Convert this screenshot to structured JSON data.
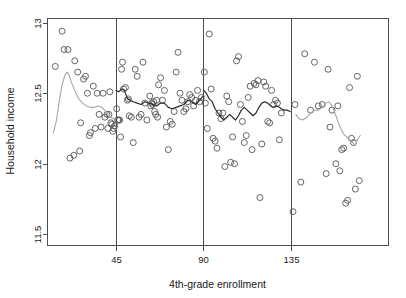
{
  "chart_data": {
    "type": "scatter",
    "title": "",
    "xlabel": "4th-grade enrollment",
    "ylabel": "Household income",
    "xlim": [
      10,
      185
    ],
    "ylim": [
      11.42,
      13.03
    ],
    "grid": false,
    "legend": "none",
    "x_ticks": [
      45,
      90,
      135
    ],
    "x_tick_labels": [
      "45",
      "90",
      "135"
    ],
    "y_ticks": [
      11.5,
      12,
      12.5,
      13
    ],
    "y_tick_labels": [
      "11.5",
      "12",
      "12.5",
      "13"
    ],
    "annotations": [
      "Three vertical reference lines drawn at x = 45, 90 and 135 split the plot into four enrollment bins",
      "A separate smoothed trend line is fitted within each of the four bins",
      "Smoothers for bins 1 and 4 are drawn light gray; smoothers for bins 2 and 3 are drawn black"
    ],
    "marker": {
      "shape": "open-circle",
      "radius_px": 3,
      "fill": "none",
      "stroke": "#555555"
    },
    "vertical_reference_lines": [
      45,
      90,
      135
    ],
    "series": [
      {
        "name": "districts",
        "type": "scatter",
        "points": [
          [
            14.0,
            12.69
          ],
          [
            17.5,
            12.94
          ],
          [
            18.5,
            12.81
          ],
          [
            20.5,
            12.81
          ],
          [
            21.5,
            12.04
          ],
          [
            23.5,
            12.06
          ],
          [
            24.0,
            12.73
          ],
          [
            25.5,
            12.65
          ],
          [
            26.5,
            12.09
          ],
          [
            27.0,
            12.29
          ],
          [
            28.5,
            12.6
          ],
          [
            29.5,
            12.62
          ],
          [
            30.5,
            12.5
          ],
          [
            31.5,
            12.2
          ],
          [
            32.0,
            12.22
          ],
          [
            33.5,
            12.55
          ],
          [
            34.5,
            12.25
          ],
          [
            35.5,
            12.5
          ],
          [
            36.5,
            12.35
          ],
          [
            37.5,
            12.26
          ],
          [
            38.5,
            12.5
          ],
          [
            39.5,
            12.33
          ],
          [
            40.5,
            12.35
          ],
          [
            41.0,
            12.25
          ],
          [
            41.5,
            12.35
          ],
          [
            42.0,
            12.51
          ],
          [
            42.5,
            12.29
          ],
          [
            43.0,
            12.28
          ],
          [
            43.5,
            12.23
          ],
          [
            44.0,
            12.25
          ],
          [
            44.5,
            12.27
          ],
          [
            45.5,
            12.39
          ],
          [
            46.0,
            12.31
          ],
          [
            46.5,
            12.31
          ],
          [
            47.0,
            12.31
          ],
          [
            47.5,
            12.19
          ],
          [
            48.0,
            12.67
          ],
          [
            48.5,
            12.72
          ],
          [
            49.0,
            12.53
          ],
          [
            50.0,
            12.54
          ],
          [
            51.0,
            12.45
          ],
          [
            51.5,
            12.46
          ],
          [
            52.0,
            12.34
          ],
          [
            53.0,
            12.33
          ],
          [
            54.0,
            12.15
          ],
          [
            55.0,
            12.67
          ],
          [
            56.0,
            12.62
          ],
          [
            57.0,
            12.33
          ],
          [
            58.0,
            12.35
          ],
          [
            59.0,
            12.72
          ],
          [
            60.0,
            12.43
          ],
          [
            61.0,
            12.31
          ],
          [
            62.5,
            12.48
          ],
          [
            63.0,
            12.41
          ],
          [
            63.5,
            12.43
          ],
          [
            64.0,
            12.42
          ],
          [
            64.5,
            12.44
          ],
          [
            65.0,
            12.37
          ],
          [
            65.5,
            12.35
          ],
          [
            66.0,
            12.45
          ],
          [
            66.5,
            12.33
          ],
          [
            67.0,
            12.56
          ],
          [
            68.0,
            12.61
          ],
          [
            69.0,
            12.45
          ],
          [
            70.0,
            12.52
          ],
          [
            71.0,
            12.26
          ],
          [
            72.0,
            12.1
          ],
          [
            73.0,
            12.3
          ],
          [
            74.0,
            12.28
          ],
          [
            75.0,
            12.37
          ],
          [
            76.0,
            12.65
          ],
          [
            77.0,
            12.79
          ],
          [
            78.0,
            12.5
          ],
          [
            79.0,
            12.45
          ],
          [
            80.0,
            12.37
          ],
          [
            81.0,
            12.39
          ],
          [
            82.0,
            12.44
          ],
          [
            83.0,
            12.49
          ],
          [
            84.0,
            12.47
          ],
          [
            85.0,
            12.41
          ],
          [
            86.0,
            12.45
          ],
          [
            87.0,
            12.52
          ],
          [
            88.0,
            12.44
          ],
          [
            89.0,
            12.47
          ],
          [
            90.5,
            12.65
          ],
          [
            91.0,
            12.43
          ],
          [
            92.0,
            12.25
          ],
          [
            93.0,
            12.92
          ],
          [
            94.0,
            12.53
          ],
          [
            95.0,
            12.18
          ],
          [
            96.0,
            12.16
          ],
          [
            97.0,
            12.11
          ],
          [
            98.0,
            12.36
          ],
          [
            99.0,
            12.32
          ],
          [
            100.0,
            12.36
          ],
          [
            101.0,
            11.98
          ],
          [
            102.0,
            12.48
          ],
          [
            103.0,
            12.44
          ],
          [
            104.0,
            12.01
          ],
          [
            105.0,
            12.19
          ],
          [
            106.0,
            12.0
          ],
          [
            107.0,
            12.73
          ],
          [
            108.0,
            12.76
          ],
          [
            109.0,
            12.42
          ],
          [
            110.0,
            12.3
          ],
          [
            111.0,
            12.15
          ],
          [
            112.0,
            12.2
          ],
          [
            113.0,
            12.47
          ],
          [
            114.0,
            12.55
          ],
          [
            115.0,
            12.1
          ],
          [
            116.0,
            12.57
          ],
          [
            117.0,
            12.56
          ],
          [
            118.0,
            12.59
          ],
          [
            119.0,
            11.76
          ],
          [
            120.0,
            12.14
          ],
          [
            121.0,
            12.58
          ],
          [
            122.0,
            12.55
          ],
          [
            123.0,
            12.3
          ],
          [
            124.0,
            12.29
          ],
          [
            125.0,
            12.52
          ],
          [
            126.0,
            12.42
          ],
          [
            127.0,
            12.45
          ],
          [
            128.0,
            12.43
          ],
          [
            129.0,
            12.17
          ],
          [
            130.0,
            12.36
          ],
          [
            136.0,
            11.66
          ],
          [
            137.0,
            12.42
          ],
          [
            140.0,
            11.87
          ],
          [
            142.0,
            12.78
          ],
          [
            145.0,
            12.38
          ],
          [
            147.0,
            12.72
          ],
          [
            149.0,
            12.41
          ],
          [
            151.0,
            12.42
          ],
          [
            153.0,
            11.93
          ],
          [
            154.0,
            12.67
          ],
          [
            155.0,
            12.26
          ],
          [
            156.0,
            12.38
          ],
          [
            158.0,
            12.0
          ],
          [
            159.0,
            12.41
          ],
          [
            160.0,
            11.95
          ],
          [
            161.0,
            12.1
          ],
          [
            162.0,
            12.11
          ],
          [
            163.0,
            11.72
          ],
          [
            164.0,
            11.74
          ],
          [
            165.0,
            12.54
          ],
          [
            166.0,
            12.18
          ],
          [
            167.0,
            12.15
          ],
          [
            168.0,
            11.82
          ],
          [
            169.0,
            12.62
          ],
          [
            170.0,
            11.88
          ]
        ]
      },
      {
        "name": "smoother-bin-1",
        "type": "line",
        "color": "#a8a8a8",
        "points": [
          [
            13.0,
            12.22
          ],
          [
            14.5,
            12.3
          ],
          [
            16.0,
            12.44
          ],
          [
            17.5,
            12.56
          ],
          [
            19.0,
            12.63
          ],
          [
            20.0,
            12.65
          ],
          [
            21.0,
            12.63
          ],
          [
            22.5,
            12.57
          ],
          [
            24.0,
            12.52
          ],
          [
            26.0,
            12.46
          ],
          [
            28.0,
            12.43
          ],
          [
            30.0,
            12.41
          ],
          [
            32.0,
            12.4
          ],
          [
            34.0,
            12.4
          ],
          [
            36.0,
            12.41
          ],
          [
            38.0,
            12.4
          ],
          [
            40.0,
            12.37
          ],
          [
            42.0,
            12.34
          ],
          [
            43.5,
            12.32
          ],
          [
            44.8,
            12.32
          ]
        ]
      },
      {
        "name": "smoother-bin-2",
        "type": "line",
        "color": "#2b2b2b",
        "points": [
          [
            45.2,
            12.52
          ],
          [
            46.5,
            12.51
          ],
          [
            48.0,
            12.53
          ],
          [
            49.5,
            12.52
          ],
          [
            51.0,
            12.46
          ],
          [
            52.5,
            12.45
          ],
          [
            54.0,
            12.44
          ],
          [
            56.0,
            12.43
          ],
          [
            58.0,
            12.42
          ],
          [
            60.0,
            12.44
          ],
          [
            62.0,
            12.43
          ],
          [
            64.0,
            12.42
          ],
          [
            66.0,
            12.41
          ],
          [
            68.0,
            12.43
          ],
          [
            70.0,
            12.43
          ],
          [
            72.0,
            12.4
          ],
          [
            74.0,
            12.39
          ],
          [
            76.0,
            12.4
          ],
          [
            78.0,
            12.41
          ],
          [
            80.0,
            12.42
          ],
          [
            82.0,
            12.45
          ],
          [
            84.0,
            12.44
          ],
          [
            86.0,
            12.42
          ],
          [
            88.0,
            12.45
          ],
          [
            89.8,
            12.48
          ]
        ]
      },
      {
        "name": "smoother-bin-3",
        "type": "line",
        "color": "#2b2b2b",
        "points": [
          [
            90.2,
            12.52
          ],
          [
            91.5,
            12.5
          ],
          [
            93.0,
            12.46
          ],
          [
            94.5,
            12.44
          ],
          [
            96.0,
            12.39
          ],
          [
            97.5,
            12.36
          ],
          [
            99.0,
            12.33
          ],
          [
            100.5,
            12.31
          ],
          [
            102.0,
            12.33
          ],
          [
            103.5,
            12.35
          ],
          [
            105.0,
            12.33
          ],
          [
            106.5,
            12.31
          ],
          [
            108.0,
            12.34
          ],
          [
            109.5,
            12.38
          ],
          [
            111.0,
            12.4
          ],
          [
            112.5,
            12.38
          ],
          [
            114.0,
            12.36
          ],
          [
            115.5,
            12.34
          ],
          [
            117.0,
            12.36
          ],
          [
            118.5,
            12.4
          ],
          [
            120.0,
            12.43
          ],
          [
            121.5,
            12.44
          ],
          [
            123.0,
            12.43
          ],
          [
            124.5,
            12.41
          ],
          [
            126.0,
            12.4
          ],
          [
            127.5,
            12.41
          ],
          [
            129.0,
            12.4
          ],
          [
            130.0,
            12.39
          ],
          [
            131.5,
            12.38
          ],
          [
            133.0,
            12.38
          ],
          [
            134.5,
            12.37
          ]
        ]
      },
      {
        "name": "smoother-bin-4",
        "type": "line",
        "color": "#a8a8a8",
        "points": [
          [
            137.5,
            12.35
          ],
          [
            139.0,
            12.32
          ],
          [
            141.0,
            12.31
          ],
          [
            143.0,
            12.33
          ],
          [
            145.0,
            12.36
          ],
          [
            147.0,
            12.38
          ],
          [
            149.0,
            12.38
          ],
          [
            151.0,
            12.4
          ],
          [
            153.0,
            12.43
          ],
          [
            154.5,
            12.44
          ],
          [
            156.0,
            12.41
          ],
          [
            157.5,
            12.36
          ],
          [
            159.0,
            12.3
          ],
          [
            160.5,
            12.25
          ],
          [
            162.0,
            12.21
          ],
          [
            163.5,
            12.19
          ],
          [
            165.0,
            12.17
          ],
          [
            166.5,
            12.15
          ],
          [
            168.0,
            12.13
          ],
          [
            169.0,
            12.17
          ],
          [
            170.5,
            12.2
          ]
        ]
      }
    ]
  }
}
